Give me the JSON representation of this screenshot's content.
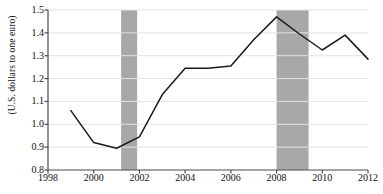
{
  "chart_data": {
    "type": "line",
    "title": "",
    "subtitle": "",
    "xlabel": "",
    "ylabel": "(U.S. dollars to one euro)",
    "xlim": [
      1998,
      2012
    ],
    "ylim": [
      0.8,
      1.5
    ],
    "grid": true,
    "legend": "none",
    "x": [
      1999,
      2000,
      2001,
      2002,
      2003,
      2004,
      2005,
      2006,
      2007,
      2008,
      2009,
      2010,
      2011,
      2012
    ],
    "values": [
      1.06,
      0.92,
      0.895,
      0.945,
      1.13,
      1.245,
      1.245,
      1.255,
      1.37,
      1.47,
      1.395,
      1.325,
      1.39,
      1.285
    ],
    "series": [
      {
        "name": "U.S. dollars to one euro",
        "values": [
          1.06,
          0.92,
          0.895,
          0.945,
          1.13,
          1.245,
          1.245,
          1.255,
          1.37,
          1.47,
          1.395,
          1.325,
          1.39,
          1.285
        ]
      }
    ],
    "xticks": [
      1998,
      2000,
      2002,
      2004,
      2006,
      2008,
      2010,
      2012
    ],
    "xtick_labels": [
      "1998",
      "2000",
      "2002",
      "2004",
      "2006",
      "2008",
      "2010",
      "2012"
    ],
    "yticks": [
      0.8,
      0.9,
      1.0,
      1.1,
      1.2,
      1.3,
      1.4,
      1.5
    ],
    "ytick_labels": [
      "0.8",
      "0.9",
      "1.0",
      "1.1",
      "1.2",
      "1.3",
      "1.4",
      "1.5"
    ],
    "shaded_bands": [
      {
        "name": "recession-band-2001",
        "start": 2001.2,
        "end": 2001.9
      },
      {
        "name": "recession-band-2008",
        "start": 2008.0,
        "end": 2009.4
      }
    ],
    "colors": {
      "line": "#1a1a1a",
      "band": "#a8a8a8",
      "grid": "#e2e2e2",
      "axis": "#4a4a4a",
      "text": "#111111",
      "background": "#ffffff"
    }
  }
}
